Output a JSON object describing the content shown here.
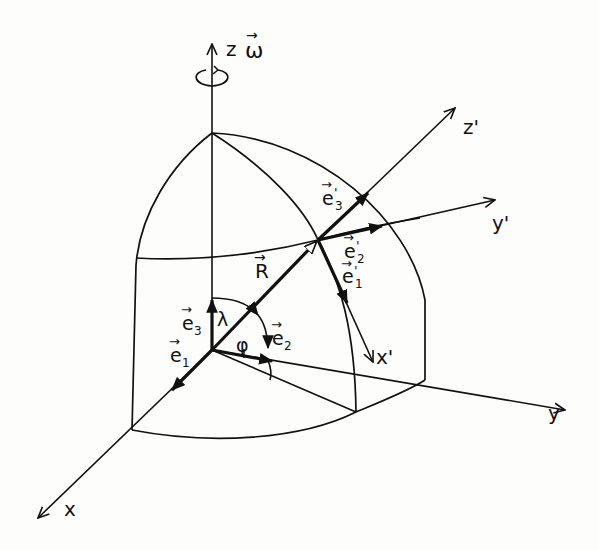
{
  "diagram": {
    "axes": {
      "x": "x",
      "y": "y",
      "z": "z",
      "x_prime": "x'",
      "y_prime": "y'",
      "z_prime": "z'"
    },
    "rotation": {
      "symbol": "ω",
      "description": "angular velocity vector along z-axis"
    },
    "vectors": {
      "R": "R",
      "e1": "e",
      "e1_sub": "1",
      "e2": "e",
      "e2_sub": "2",
      "e3": "e",
      "e3_sub": "3",
      "e1_prime": "e",
      "e1_prime_sub": "1",
      "e2_prime": "e",
      "e2_prime_sub": "2",
      "e3_prime": "e",
      "e3_prime_sub": "3",
      "prime_mark": "'",
      "arrow_mark": "→"
    },
    "angles": {
      "latitude": "λ",
      "longitude": "φ"
    },
    "colors": {
      "ink": "#111111",
      "paper": "#fdfdfb"
    }
  }
}
